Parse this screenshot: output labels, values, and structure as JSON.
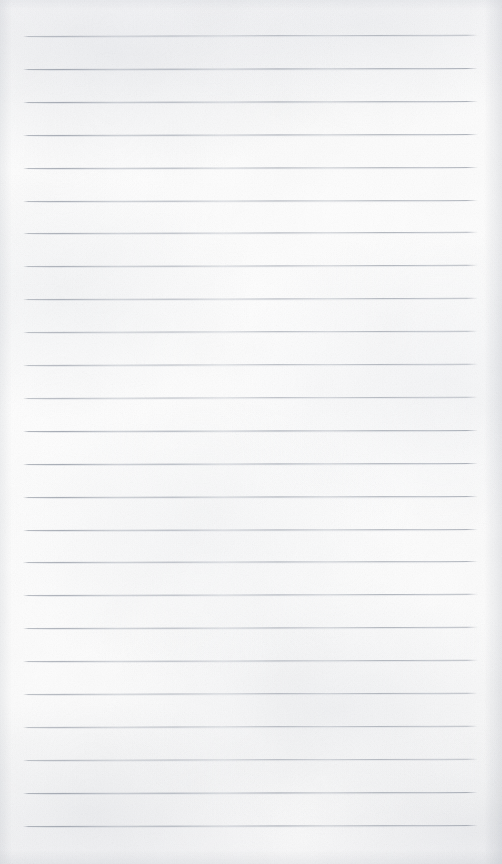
{
  "document": {
    "kind": "scanned-ruled-notepad-page",
    "title": "Blank ruled notepad page",
    "description": "A scanned blank sheet of lined writing paper with evenly spaced horizontal ruled lines and no handwriting or printed text.",
    "has_text_content": false,
    "text_content": "",
    "page_width_px": 502,
    "page_height_px": 864
  },
  "colors": {
    "paper_background": "#fdfdfd",
    "paper_shadow": "#e8eaee",
    "rule_line": "#969cA6",
    "rule_line_faint": "#b0b6c0"
  },
  "ruling": {
    "line_count": 25,
    "first_line_y": 36,
    "line_pitch_px": 32.9,
    "line_thickness_px": 1,
    "left_margin_px": 23,
    "right_margin_px": 24,
    "line_start_x": 23,
    "line_end_x": 478,
    "line_length_px": 455,
    "skew_degrees": -0.14,
    "top_margin_px": 36,
    "bottom_margin_px": 38,
    "lines_y": [
      36,
      68.9,
      101.8,
      134.7,
      167.6,
      200.5,
      233.4,
      266.3,
      299.2,
      332.1,
      365.0,
      397.9,
      430.8,
      463.7,
      496.6,
      529.5,
      562.4,
      595.3,
      628.2,
      661.1,
      694.0,
      726.9,
      759.8,
      792.7,
      825.6
    ]
  }
}
